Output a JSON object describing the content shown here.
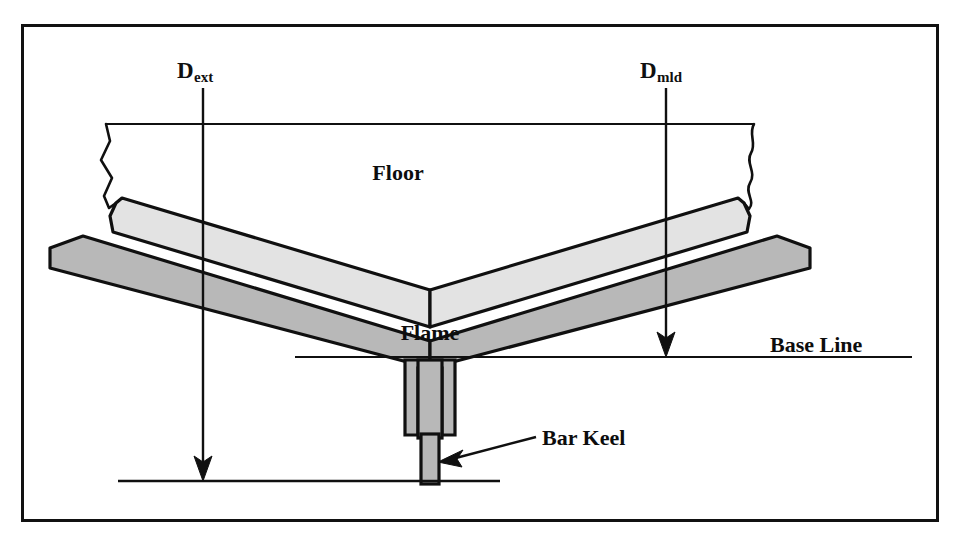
{
  "figure": {
    "border_color": "#111111",
    "background": "#ffffff"
  },
  "labels": {
    "d_ext": {
      "base": "D",
      "sub": "ext"
    },
    "d_mld": {
      "base": "D",
      "sub": "mld"
    },
    "floor": "Floor",
    "flame": "Flame",
    "base_line": "Base Line",
    "bar_keel": "Bar Keel"
  },
  "colors": {
    "outline": "#101010",
    "floor_fill": "#e3e3e3",
    "plating_fill": "#b8b8b8",
    "keel_fill": "#b8b8b8",
    "line": "#101010",
    "page": "#ffffff"
  },
  "geometry": {
    "border": {
      "x": 22,
      "y": 25,
      "width": 916,
      "height": 496
    },
    "dimension_lines": [
      {
        "name": "D_ext",
        "x": 203,
        "y_top": 88,
        "y_bottom": 481
      },
      {
        "name": "D_mld",
        "x": 666,
        "y_top": 88,
        "y_bottom": 357
      }
    ],
    "base_line": {
      "x1": 295,
      "x2": 912,
      "y": 357
    },
    "bottom_line": {
      "x1": 118,
      "x2": 500,
      "y": 481
    },
    "apex": {
      "x": 430,
      "y": 357
    }
  }
}
